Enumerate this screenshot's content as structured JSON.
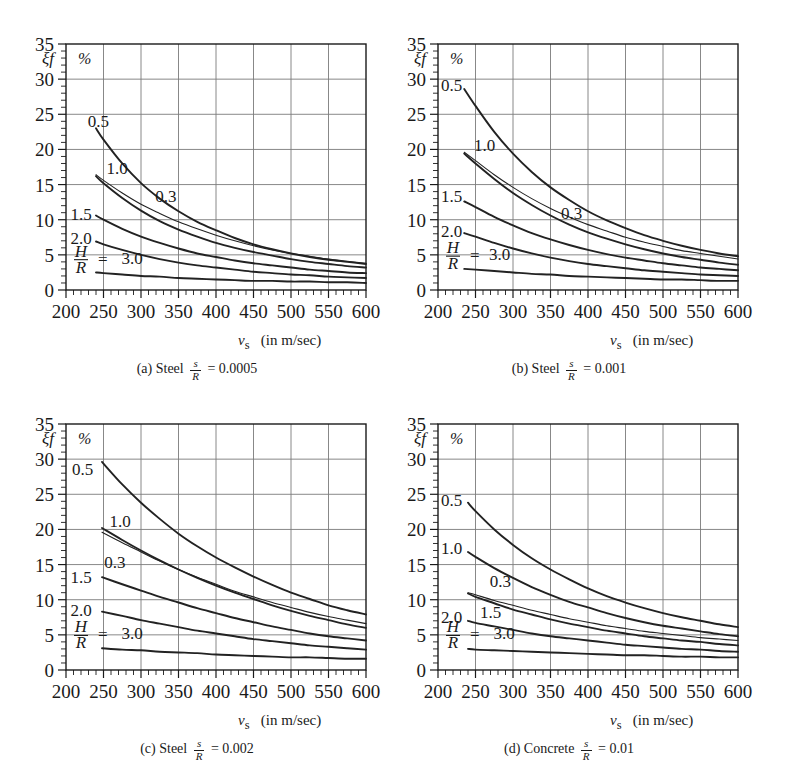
{
  "figure": {
    "panels": [
      {
        "id": "a",
        "caption_index": "(a)",
        "caption_material": "Steel",
        "caption_frac_num": "s",
        "caption_frac_den": "R",
        "caption_eq": "= 0.0005"
      },
      {
        "id": "b",
        "caption_index": "(b)",
        "caption_material": "Steel",
        "caption_frac_num": "s",
        "caption_frac_den": "R",
        "caption_eq": "= 0.001"
      },
      {
        "id": "c",
        "caption_index": "(c)",
        "caption_material": "Steel",
        "caption_frac_num": "s",
        "caption_frac_den": "R",
        "caption_eq": "= 0.002"
      },
      {
        "id": "d",
        "caption_index": "(d)",
        "caption_material": "Concrete",
        "caption_frac_num": "s",
        "caption_frac_den": "R",
        "caption_eq": "= 0.01"
      }
    ],
    "axis": {
      "x_symbol": "v",
      "x_subscript": "s",
      "x_units": "(in m/sec)",
      "y_symbol": "ξf",
      "y_unit_label": "%",
      "hr_num": "H",
      "hr_den": "R",
      "hr_eq": "="
    },
    "colors": {
      "ink": "#1a1a1a",
      "grid": "#7a7a7a",
      "curve": "#222222",
      "background": "#ffffff"
    }
  },
  "chart_data": [
    {
      "type": "line",
      "title": "(a) Steel s/R = 0.0005",
      "xlabel": "v_s (in m/sec)",
      "ylabel": "ξf %",
      "xlim": [
        200,
        600
      ],
      "ylim": [
        0,
        35
      ],
      "xticks": [
        200,
        250,
        300,
        350,
        400,
        450,
        500,
        550,
        600
      ],
      "yticks": [
        0,
        5,
        10,
        15,
        20,
        25,
        30,
        35
      ],
      "minor_x_step": 10,
      "minor_y_step": 1,
      "grid": true,
      "legend": "inline-curve-labels",
      "x": [
        240,
        250,
        275,
        300,
        325,
        350,
        375,
        400,
        425,
        450,
        475,
        500,
        525,
        550,
        575,
        600
      ],
      "series": [
        {
          "name": "0.5",
          "label": "0.5",
          "label_x": 243,
          "label_y": 24.0,
          "values": [
            23.0,
            21.4,
            18.0,
            15.2,
            13.0,
            11.2,
            9.7,
            8.5,
            7.4,
            6.5,
            5.8,
            5.2,
            4.7,
            4.3,
            4.0,
            3.7
          ]
        },
        {
          "name": "0.3",
          "label": "0.3",
          "label_x": 333,
          "label_y": 13.4,
          "values": [
            16.4,
            15.6,
            13.8,
            12.2,
            10.9,
            9.7,
            8.7,
            7.8,
            7.0,
            6.3,
            5.7,
            5.2,
            4.8,
            4.4,
            4.1,
            3.8
          ]
        },
        {
          "name": "1.0",
          "label": "1.0",
          "label_x": 268,
          "label_y": 17.4,
          "values": [
            16.2,
            15.2,
            13.1,
            11.3,
            9.8,
            8.6,
            7.6,
            6.7,
            6.0,
            5.4,
            4.9,
            4.4,
            4.0,
            3.7,
            3.4,
            3.2
          ]
        },
        {
          "name": "1.5",
          "label": "1.5",
          "label_x": 220,
          "label_y": 10.8,
          "values": [
            10.6,
            10.0,
            8.7,
            7.6,
            6.7,
            5.9,
            5.2,
            4.7,
            4.2,
            3.8,
            3.5,
            3.2,
            2.9,
            2.7,
            2.5,
            2.4
          ]
        },
        {
          "name": "2.0",
          "label": "2.0",
          "label_x": 220,
          "label_y": 7.4,
          "values": [
            6.9,
            6.5,
            5.7,
            5.0,
            4.4,
            3.9,
            3.5,
            3.2,
            2.9,
            2.6,
            2.4,
            2.2,
            2.1,
            1.9,
            1.8,
            1.7
          ]
        },
        {
          "name": "3.0",
          "label": "3.0",
          "label_x": 288,
          "label_y": 4.6,
          "values": [
            2.5,
            2.4,
            2.2,
            2.0,
            1.9,
            1.7,
            1.6,
            1.5,
            1.4,
            1.3,
            1.3,
            1.2,
            1.2,
            1.1,
            1.1,
            1.0
          ]
        }
      ]
    },
    {
      "type": "line",
      "title": "(b) Steel s/R = 0.001",
      "xlabel": "v_s (in m/sec)",
      "ylabel": "ξf %",
      "xlim": [
        200,
        600
      ],
      "ylim": [
        0,
        35
      ],
      "xticks": [
        200,
        250,
        300,
        350,
        400,
        450,
        500,
        550,
        600
      ],
      "yticks": [
        0,
        5,
        10,
        15,
        20,
        25,
        30,
        35
      ],
      "minor_x_step": 10,
      "minor_y_step": 1,
      "grid": true,
      "legend": "inline-curve-labels",
      "x": [
        235,
        250,
        275,
        300,
        325,
        350,
        375,
        400,
        425,
        450,
        475,
        500,
        525,
        550,
        575,
        600
      ],
      "series": [
        {
          "name": "0.5",
          "label": "0.5",
          "label_x": 218,
          "label_y": 29.2,
          "values": [
            28.6,
            26.2,
            22.5,
            19.4,
            16.8,
            14.6,
            12.8,
            11.2,
            9.9,
            8.8,
            7.8,
            7.0,
            6.3,
            5.7,
            5.2,
            4.8
          ]
        },
        {
          "name": "0.3",
          "label": "0.3",
          "label_x": 378,
          "label_y": 11.0,
          "values": [
            19.6,
            18.4,
            16.4,
            14.6,
            13.0,
            11.6,
            10.4,
            9.3,
            8.4,
            7.5,
            6.8,
            6.2,
            5.6,
            5.2,
            4.8,
            4.4
          ]
        },
        {
          "name": "1.0",
          "label": "1.0",
          "label_x": 262,
          "label_y": 20.6,
          "values": [
            19.4,
            18.0,
            15.8,
            13.8,
            12.1,
            10.6,
            9.3,
            8.2,
            7.3,
            6.5,
            5.8,
            5.2,
            4.7,
            4.3,
            3.9,
            3.6
          ]
        },
        {
          "name": "1.5",
          "label": "1.5",
          "label_x": 218,
          "label_y": 13.4,
          "values": [
            12.6,
            11.8,
            10.4,
            9.2,
            8.1,
            7.2,
            6.4,
            5.7,
            5.1,
            4.6,
            4.2,
            3.8,
            3.5,
            3.2,
            3.0,
            2.8
          ]
        },
        {
          "name": "2.0",
          "label": "2.0",
          "label_x": 218,
          "label_y": 8.4,
          "values": [
            8.1,
            7.6,
            6.7,
            5.9,
            5.2,
            4.6,
            4.1,
            3.7,
            3.4,
            3.1,
            2.8,
            2.6,
            2.4,
            2.2,
            2.1,
            2.0
          ]
        },
        {
          "name": "3.0",
          "label": "3.0",
          "label_x": 282,
          "label_y": 5.1,
          "values": [
            3.0,
            2.9,
            2.7,
            2.5,
            2.3,
            2.2,
            2.0,
            1.9,
            1.8,
            1.7,
            1.6,
            1.5,
            1.5,
            1.4,
            1.3,
            1.3
          ]
        }
      ]
    },
    {
      "type": "line",
      "title": "(c) Steel s/R = 0.002",
      "xlabel": "v_s (in m/sec)",
      "ylabel": "ξf %",
      "xlim": [
        200,
        600
      ],
      "ylim": [
        0,
        35
      ],
      "xticks": [
        200,
        250,
        300,
        350,
        400,
        450,
        500,
        550,
        600
      ],
      "yticks": [
        0,
        5,
        10,
        15,
        20,
        25,
        30,
        35
      ],
      "minor_x_step": 10,
      "minor_y_step": 1,
      "grid": true,
      "legend": "inline-curve-labels",
      "x": [
        248,
        275,
        300,
        325,
        350,
        375,
        400,
        425,
        450,
        475,
        500,
        525,
        550,
        575,
        600
      ],
      "series": [
        {
          "name": "0.5",
          "label": "0.5",
          "label_x": 222,
          "label_y": 28.6,
          "values": [
            29.6,
            26.4,
            23.8,
            21.5,
            19.4,
            17.6,
            16.0,
            14.6,
            13.3,
            12.1,
            11.0,
            10.1,
            9.2,
            8.5,
            7.9
          ]
        },
        {
          "name": "0.3",
          "label": "0.3",
          "label_x": 265,
          "label_y": 15.4,
          "values": [
            19.6,
            18.1,
            16.8,
            15.5,
            14.3,
            13.2,
            12.2,
            11.2,
            10.4,
            9.6,
            8.9,
            8.2,
            7.6,
            7.1,
            6.6
          ]
        },
        {
          "name": "1.0",
          "label": "1.0",
          "label_x": 272,
          "label_y": 21.2,
          "values": [
            20.2,
            18.5,
            17.0,
            15.6,
            14.3,
            13.1,
            12.0,
            11.0,
            10.1,
            9.2,
            8.4,
            7.7,
            7.1,
            6.5,
            6.0
          ]
        },
        {
          "name": "1.5",
          "label": "1.5",
          "label_x": 220,
          "label_y": 13.2,
          "values": [
            13.2,
            12.2,
            11.3,
            10.4,
            9.6,
            8.8,
            8.1,
            7.4,
            6.8,
            6.2,
            5.7,
            5.2,
            4.8,
            4.5,
            4.2
          ]
        },
        {
          "name": "2.0",
          "label": "2.0",
          "label_x": 220,
          "label_y": 8.6,
          "values": [
            8.3,
            7.7,
            7.1,
            6.6,
            6.1,
            5.6,
            5.2,
            4.8,
            4.4,
            4.1,
            3.8,
            3.5,
            3.3,
            3.1,
            2.9
          ]
        },
        {
          "name": "3.0",
          "label": "3.0",
          "label_x": 288,
          "label_y": 5.2,
          "values": [
            3.1,
            2.9,
            2.8,
            2.6,
            2.5,
            2.4,
            2.2,
            2.1,
            2.0,
            1.9,
            1.8,
            1.8,
            1.7,
            1.6,
            1.6
          ]
        }
      ]
    },
    {
      "type": "line",
      "title": "(d) Concrete s/R = 0.01",
      "xlabel": "v_s (in m/sec)",
      "ylabel": "ξf %",
      "xlim": [
        200,
        600
      ],
      "ylim": [
        0,
        35
      ],
      "xticks": [
        200,
        250,
        300,
        350,
        400,
        450,
        500,
        550,
        600
      ],
      "yticks": [
        0,
        5,
        10,
        15,
        20,
        25,
        30,
        35
      ],
      "minor_x_step": 10,
      "minor_y_step": 1,
      "grid": true,
      "legend": "inline-curve-labels",
      "x": [
        240,
        250,
        275,
        300,
        325,
        350,
        375,
        400,
        425,
        450,
        475,
        500,
        525,
        550,
        575,
        600
      ],
      "series": [
        {
          "name": "0.5",
          "label": "0.5",
          "label_x": 218,
          "label_y": 24.2,
          "values": [
            23.8,
            22.6,
            20.0,
            17.8,
            15.9,
            14.3,
            12.9,
            11.6,
            10.5,
            9.6,
            8.8,
            8.1,
            7.5,
            7.0,
            6.5,
            6.1
          ]
        },
        {
          "name": "1.0",
          "label": "1.0",
          "label_x": 218,
          "label_y": 17.4,
          "values": [
            16.8,
            16.1,
            14.5,
            13.1,
            11.8,
            10.7,
            9.7,
            8.9,
            8.1,
            7.4,
            6.8,
            6.3,
            5.9,
            5.5,
            5.1,
            4.8
          ]
        },
        {
          "name": "0.3",
          "label": "0.3",
          "label_x": 283,
          "label_y": 12.6,
          "values": [
            11.0,
            10.7,
            9.9,
            9.2,
            8.5,
            7.9,
            7.3,
            6.8,
            6.3,
            5.9,
            5.5,
            5.2,
            4.9,
            4.6,
            4.4,
            4.2
          ]
        },
        {
          "name": "1.5",
          "label": "1.5",
          "label_x": 270,
          "label_y": 8.2,
          "values": [
            10.9,
            10.4,
            9.5,
            8.6,
            7.9,
            7.2,
            6.6,
            6.1,
            5.6,
            5.2,
            4.8,
            4.5,
            4.2,
            4.0,
            3.7,
            3.5
          ]
        },
        {
          "name": "2.0",
          "label": "2.0",
          "label_x": 218,
          "label_y": 7.6,
          "values": [
            7.0,
            6.7,
            6.2,
            5.7,
            5.2,
            4.8,
            4.5,
            4.2,
            3.9,
            3.6,
            3.4,
            3.2,
            3.0,
            2.9,
            2.7,
            2.6
          ]
        },
        {
          "name": "3.0",
          "label": "3.0",
          "label_x": 288,
          "label_y": 5.2,
          "values": [
            3.0,
            2.9,
            2.8,
            2.7,
            2.6,
            2.5,
            2.4,
            2.3,
            2.2,
            2.1,
            2.1,
            2.0,
            1.9,
            1.9,
            1.8,
            1.8
          ]
        }
      ]
    }
  ]
}
